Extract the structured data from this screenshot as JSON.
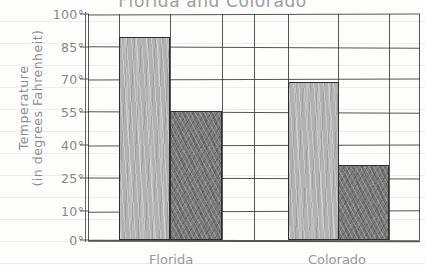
{
  "chart_data": {
    "type": "bar",
    "title": "Florida and Colorado",
    "xlabel": "",
    "ylabel": "Temperature (in degrees Fahrenheit)",
    "ylabel_line1": "Temperature",
    "ylabel_line2": "(in degrees Fahrenheit)",
    "ylim": [
      0,
      100
    ],
    "ytick_values": [
      0,
      10,
      25,
      40,
      55,
      70,
      85,
      100
    ],
    "ytick_labels": [
      "0°",
      "10°",
      "25°",
      "40°",
      "55°",
      "70°",
      "85°",
      "100°"
    ],
    "grid": true,
    "legend": "none",
    "categories": [
      "Florida",
      "Colorado"
    ],
    "series": [
      {
        "name": "Summer",
        "values": [
          90,
          70
        ],
        "color": "#b2b2b2"
      },
      {
        "name": "Winter",
        "values": [
          57,
          33
        ],
        "color": "#7c7c7c"
      }
    ],
    "bars": [
      {
        "label": "Florida Summer",
        "value": 90,
        "style": "light"
      },
      {
        "label": "Florida Winter",
        "value": 57,
        "style": "dark"
      },
      {
        "label": "Colorado Summer",
        "value": 70,
        "style": "light"
      },
      {
        "label": "Colorado Winter",
        "value": 33,
        "style": "dark"
      }
    ],
    "xtick_labels": [
      "Florida",
      "Colorado"
    ]
  },
  "colors": {
    "bar_light": "#b2b2b2",
    "bar_dark": "#7c7c7c",
    "grid_line": "#3a3a3a",
    "pencil_text": "#8b8b8f",
    "paper": "#fdfdfc",
    "rule_line": "#8494a4"
  }
}
